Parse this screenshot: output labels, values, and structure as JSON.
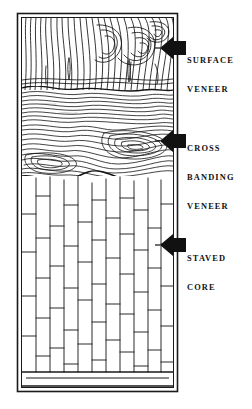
{
  "figure": {
    "type": "technical-line-diagram",
    "background_color": "#ffffff",
    "ink_color": "#111111"
  },
  "panel": {
    "border_style": "double-rule",
    "layers": [
      {
        "id": "surface-veneer",
        "name": "Surface veneer",
        "pattern": "vertical flowing wood grain",
        "top": 18,
        "bottom": 88
      },
      {
        "id": "cross-banding-veneer",
        "name": "Cross banding veneer",
        "pattern": "horizontal swirled wood grain",
        "top": 88,
        "bottom": 178
      },
      {
        "id": "staved-core",
        "name": "Staved core",
        "pattern": "staggered vertical staves",
        "top": 178,
        "bottom": 372
      },
      {
        "id": "bottom-band",
        "name": "Bottom edge band",
        "pattern": "plain horizontal band",
        "top": 372,
        "bottom": 388
      }
    ]
  },
  "labels": [
    {
      "id": "surface-veneer",
      "lines": [
        "SURFACE",
        "VENEER"
      ],
      "line1": "SURFACE",
      "line2": "VENEER",
      "arrow": "left-arrow-icon",
      "arrow_y": 48
    },
    {
      "id": "cross-banding-veneer",
      "lines": [
        "CROSS",
        "BANDING",
        "VENEER"
      ],
      "line1": "CROSS",
      "line2": "BANDING",
      "line3": "VENEER",
      "arrow": "left-arrow-icon",
      "arrow_y": 141
    },
    {
      "id": "staved-core",
      "lines": [
        "STAVED",
        "CORE"
      ],
      "line1": "STAVED",
      "line2": "CORE",
      "arrow": "left-arrow-icon",
      "arrow_y": 245
    }
  ]
}
